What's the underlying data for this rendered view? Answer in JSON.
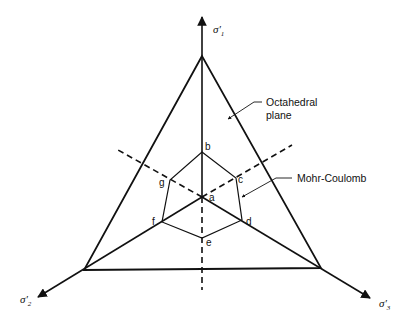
{
  "diagram": {
    "type": "octahedral plane section of principal stress space",
    "axes": [
      {
        "id": "sigma1",
        "label": "σ′",
        "subscript": "1"
      },
      {
        "id": "sigma2",
        "label": "σ′",
        "subscript": "2"
      },
      {
        "id": "sigma3",
        "label": "σ′",
        "subscript": "3"
      }
    ],
    "points": [
      "a",
      "b",
      "c",
      "d",
      "e",
      "f",
      "g"
    ],
    "annotations": {
      "octahedral_line1": "Octahedral",
      "octahedral_line2": "plane",
      "mohr_coulomb": "Mohr-Coulomb"
    },
    "colors": {
      "line": "#111111",
      "background": "#ffffff"
    }
  }
}
